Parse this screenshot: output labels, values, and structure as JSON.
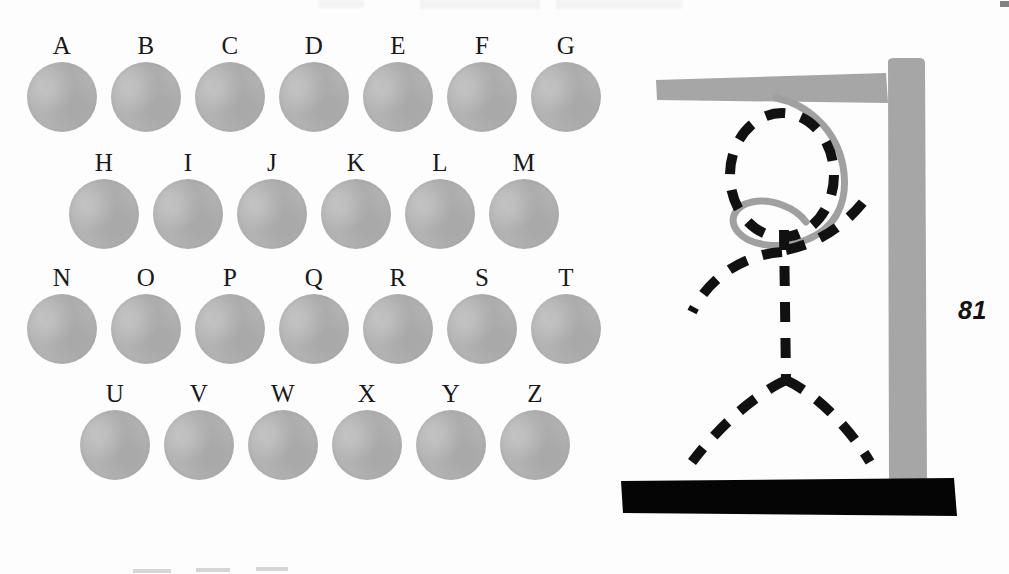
{
  "page": {
    "kind": "hangman-puzzle-page",
    "page_number": "81",
    "background_color": "#fdfdfd"
  },
  "alphabet_grid": {
    "name": "alphabet-letter-grid",
    "disc_color": "#b3b3b3",
    "letter_color": "#18181a",
    "rows": [
      {
        "row_index": 1,
        "left": 27,
        "top": 33,
        "gap": 14,
        "letters": [
          {
            "label": "A",
            "selected": false
          },
          {
            "label": "B",
            "selected": false
          },
          {
            "label": "C",
            "selected": false
          },
          {
            "label": "D",
            "selected": false
          },
          {
            "label": "E",
            "selected": false
          },
          {
            "label": "F",
            "selected": false
          },
          {
            "label": "G",
            "selected": false
          }
        ]
      },
      {
        "row_index": 2,
        "left": 69,
        "top": 150,
        "gap": 14,
        "letters": [
          {
            "label": "H",
            "selected": false
          },
          {
            "label": "I",
            "selected": false
          },
          {
            "label": "J",
            "selected": false
          },
          {
            "label": "K",
            "selected": false
          },
          {
            "label": "L",
            "selected": false
          },
          {
            "label": "M",
            "selected": false
          }
        ]
      },
      {
        "row_index": 3,
        "left": 27,
        "top": 265,
        "gap": 14,
        "letters": [
          {
            "label": "N",
            "selected": false
          },
          {
            "label": "O",
            "selected": false
          },
          {
            "label": "P",
            "selected": false
          },
          {
            "label": "Q",
            "selected": false
          },
          {
            "label": "R",
            "selected": false
          },
          {
            "label": "S",
            "selected": false
          },
          {
            "label": "T",
            "selected": false
          }
        ]
      },
      {
        "row_index": 4,
        "left": 80,
        "top": 381,
        "gap": 14,
        "letters": [
          {
            "label": "U",
            "selected": false
          },
          {
            "label": "V",
            "selected": false
          },
          {
            "label": "W",
            "selected": false
          },
          {
            "label": "X",
            "selected": false
          },
          {
            "label": "Y",
            "selected": false
          },
          {
            "label": "Z",
            "selected": false
          }
        ]
      }
    ]
  },
  "gallows": {
    "name": "hangman-gallows-illustration",
    "structure_color": "#a6a6a6",
    "rope_color": "#a0a0a0",
    "figure_color": "#111111",
    "base_color": "#050505",
    "parts": [
      {
        "part": "top-beam",
        "drawn": true
      },
      {
        "part": "vertical-post",
        "drawn": true
      },
      {
        "part": "rope",
        "drawn": true
      },
      {
        "part": "head",
        "drawn": true
      },
      {
        "part": "body",
        "drawn": true
      },
      {
        "part": "left-arm",
        "drawn": true
      },
      {
        "part": "right-arm",
        "drawn": true
      },
      {
        "part": "left-leg",
        "drawn": true
      },
      {
        "part": "right-leg",
        "drawn": true
      },
      {
        "part": "base-platform",
        "drawn": true
      }
    ]
  },
  "artifacts": {
    "top_smudges": [
      {
        "left": 318,
        "top": 0,
        "width": 46,
        "height": 8
      },
      {
        "left": 420,
        "top": 0,
        "width": 120,
        "height": 9
      },
      {
        "left": 556,
        "top": 0,
        "width": 126,
        "height": 9
      }
    ],
    "corner_mark": {
      "left": 1000,
      "top": 1,
      "width": 9,
      "height": 6
    },
    "bottom_marks": [
      {
        "left": 133,
        "top": 569,
        "width": 38,
        "height": 4
      },
      {
        "left": 196,
        "top": 568,
        "width": 34,
        "height": 4
      },
      {
        "left": 256,
        "top": 567,
        "width": 32,
        "height": 4
      }
    ]
  }
}
